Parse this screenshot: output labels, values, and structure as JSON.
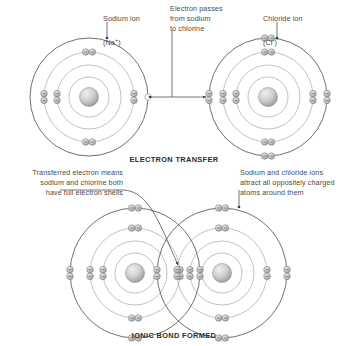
{
  "diagram": {
    "title_top": "ELECTRON TRANSFER",
    "title_bottom": "IONIC BOND FORMED",
    "labels": {
      "sodium_ion": "Sodium ion\n(Na+)",
      "sodium_ion_line1": "Sodium ion",
      "sodium_ion_line2": "(Na",
      "sodium_ion_charge": "+",
      "sodium_ion_line2_end": ")",
      "electron_passes": "Electron passes\nfrom sodium\nto chlorine",
      "chloride_ion_line1": "Chloride ion",
      "chloride_ion_line2": "(Cl",
      "chloride_ion_charge": "-",
      "chloride_ion_line2_end": ")",
      "transferred_note": "Transferred electron means\nsodium and chlorine both\nhave full electron shells",
      "attract_note": "Sodium and chloride ions\nattract all oppositely charged\natoms around them"
    },
    "colors": {
      "shell_stroke": "#8d8d8d",
      "outer_shell_stroke": "#555555",
      "electron_fill_light": "#d9d9d9",
      "electron_fill_dark": "#9a9a9a",
      "electron_stroke": "#7a7a7a",
      "nucleus_light": "#e6e6e6",
      "nucleus_dark": "#9d9d9d",
      "text": "#4a4a4a",
      "caption": "#2c2c2c",
      "arrow": "#3a3a3a"
    },
    "atoms": {
      "sodium_top": {
        "name": "sodium-ion",
        "cx": 89,
        "cy": 97,
        "shells": [
          20,
          32,
          45,
          59
        ],
        "electron_counts": [
          2,
          8,
          0
        ],
        "empty_marker": true
      },
      "chlorine_top": {
        "name": "chloride-ion",
        "cx": 268,
        "cy": 97,
        "shells": [
          20,
          32,
          45,
          59
        ],
        "electron_counts": [
          2,
          8,
          8
        ]
      },
      "sodium_bottom": {
        "name": "sodium-ion-bonded",
        "cx": 135,
        "cy": 273,
        "shells": [
          20,
          32,
          45,
          65
        ],
        "electron_counts": [
          2,
          8,
          8
        ]
      },
      "chlorine_bottom": {
        "name": "chloride-ion-bonded",
        "cx": 222,
        "cy": 273,
        "shells": [
          20,
          32,
          45,
          65
        ],
        "electron_counts": [
          2,
          8,
          8
        ]
      }
    },
    "chart_data": {
      "type": "diagram",
      "title": "Ionic bonding of sodium and chlorine",
      "stages": [
        {
          "caption": "ELECTRON TRANSFER",
          "items": [
            {
              "species": "Sodium ion",
              "formula": "Na+",
              "shell_electrons": [
                2,
                8,
                0
              ]
            },
            {
              "species": "Chloride ion",
              "formula": "Cl-",
              "shell_electrons": [
                2,
                8,
                8
              ]
            }
          ],
          "annotation": "Electron passes from sodium to chlorine"
        },
        {
          "caption": "IONIC BOND FORMED",
          "items": [
            {
              "species": "Sodium ion",
              "formula": "Na+",
              "shell_electrons": [
                2,
                8,
                8
              ]
            },
            {
              "species": "Chloride ion",
              "formula": "Cl-",
              "shell_electrons": [
                2,
                8,
                8
              ]
            }
          ],
          "annotations": [
            "Transferred electron means sodium and chlorine both have full electron shells",
            "Sodium and chloride ions attract all oppositely charged atoms around them"
          ]
        }
      ]
    }
  }
}
